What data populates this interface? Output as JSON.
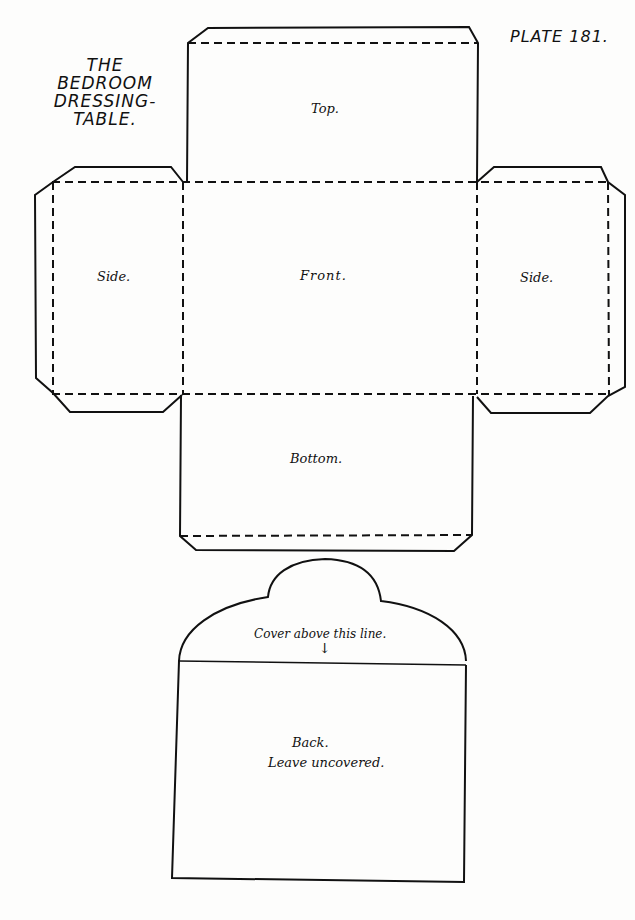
{
  "plate": {
    "label": "PLATE 181."
  },
  "title": {
    "lines": [
      "THE",
      "BEDROOM",
      "DRESSING-",
      "TABLE."
    ]
  },
  "panels": {
    "top": "Top.",
    "front": "Front.",
    "side_left": "Side.",
    "side_right": "Side.",
    "bottom": "Bottom.",
    "cover_note": "Cover above this line.",
    "cover_arrow": "↓",
    "back_line1": "Back.",
    "back_line2": "Leave uncovered."
  },
  "legend": {
    "solid_line": "cut line",
    "dashed_line": "fold line"
  }
}
